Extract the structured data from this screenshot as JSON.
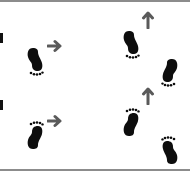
{
  "figure": {
    "colors": {
      "footprint": "#0d0d0d",
      "arrow": "#5a5a5a",
      "rule": "#8c8c8c",
      "background": "#ffffff"
    },
    "panels": [
      {
        "id": "top-left",
        "footprints": [
          {
            "foot": "left",
            "direction": "heel-up"
          }
        ],
        "arrow": "right"
      },
      {
        "id": "top-right",
        "footprints": [
          {
            "foot": "left",
            "direction": "heel-up"
          },
          {
            "foot": "right",
            "direction": "heel-up"
          }
        ],
        "arrow": "up"
      },
      {
        "id": "bottom-left",
        "footprints": [
          {
            "foot": "right",
            "direction": "toes-up"
          }
        ],
        "arrow": "right"
      },
      {
        "id": "bottom-right",
        "footprints": [
          {
            "foot": "left",
            "direction": "toes-up"
          },
          {
            "foot": "right",
            "direction": "toes-up"
          }
        ],
        "arrow": "up"
      }
    ]
  }
}
